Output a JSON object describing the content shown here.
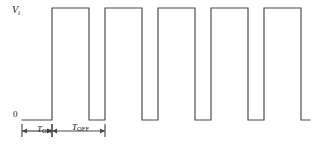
{
  "figure": {
    "type": "waveform-timing-diagram",
    "background_color": "#ffffff",
    "line_color": "#4d4d4d",
    "line_width": 1.2
  },
  "labels": {
    "signal": {
      "base": "V",
      "subscript": "i",
      "x": 12,
      "y": 5
    },
    "zero": {
      "text": "0",
      "x": 13,
      "y": 110
    },
    "t_on": {
      "base": "T",
      "subscript": "ON",
      "x": 37,
      "y": 125
    },
    "t_off": {
      "base": "T",
      "subscript": "OFF",
      "x": 72,
      "y": 123
    }
  },
  "chart_data": {
    "type": "line",
    "title": "",
    "xlabel": "",
    "ylabel": "Vi",
    "axis": {
      "baseline_y": 120,
      "high_y": 8,
      "x_start": 22,
      "x_end": 310
    },
    "gridlines": false,
    "legend": null,
    "waveform": {
      "name": "Vi",
      "shape": "square-pulse-train",
      "low_level": 0,
      "high_level": 1,
      "period_px": 53,
      "t_on_px": 33,
      "t_off_px": 37,
      "duty_cycle": 0.7,
      "pulse_count": 5,
      "start_low_px": 22,
      "edges_px": [
        52,
        89,
        105,
        142,
        158,
        195,
        211,
        248,
        264,
        301
      ],
      "points": [
        [
          22,
          120
        ],
        [
          52,
          120
        ],
        [
          52,
          8
        ],
        [
          89,
          8
        ],
        [
          89,
          120
        ],
        [
          105,
          120
        ],
        [
          105,
          8
        ],
        [
          142,
          8
        ],
        [
          142,
          120
        ],
        [
          158,
          120
        ],
        [
          158,
          8
        ],
        [
          195,
          8
        ],
        [
          195,
          120
        ],
        [
          211,
          120
        ],
        [
          211,
          8
        ],
        [
          248,
          8
        ],
        [
          248,
          120
        ],
        [
          264,
          120
        ],
        [
          264,
          8
        ],
        [
          301,
          8
        ],
        [
          301,
          120
        ],
        [
          310,
          120
        ]
      ]
    },
    "dimension_markers": [
      {
        "name": "T_ON",
        "x1": 22,
        "x2": 52,
        "y": 131,
        "tick_top": 124,
        "tick_bottom": 137
      },
      {
        "name": "T_OFF",
        "x1": 52,
        "x2": 105,
        "y": 131,
        "tick_top": 124,
        "tick_bottom": 137
      }
    ]
  }
}
